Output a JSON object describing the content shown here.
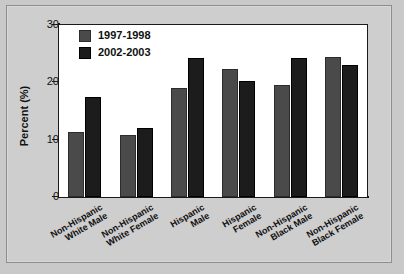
{
  "chart_data": {
    "type": "bar",
    "title": "",
    "xlabel": "",
    "ylabel": "Percent (%)",
    "ylim": [
      0,
      30
    ],
    "yticks": [
      0,
      10,
      20,
      30
    ],
    "ytick_labels": [
      "0",
      "10",
      "20",
      "30"
    ],
    "grid": false,
    "legend_position": "top-left-inside",
    "categories": [
      "Non-Hispanic\nWhite Male",
      "Non-Hispanic\nWhite Female",
      "Hispanic\nMale",
      "Hispanic\nFemale",
      "Non-Hispanic\nBlack Male",
      "Non-Hispanic\nBlack Female"
    ],
    "series": [
      {
        "name": "1997-1998",
        "color": "#4a4a4a",
        "values": [
          11.3,
          10.9,
          19.1,
          22.4,
          19.5,
          24.4
        ]
      },
      {
        "name": "2002-2003",
        "color": "#1c1c1c",
        "values": [
          17.4,
          12.1,
          24.3,
          20.2,
          24.2,
          23.1
        ]
      }
    ]
  },
  "figure": {
    "background_color": "#c9c9c9",
    "panel_color": "#cecece",
    "plot_color": "#ffffff",
    "axis_color": "#1a1a1a"
  }
}
